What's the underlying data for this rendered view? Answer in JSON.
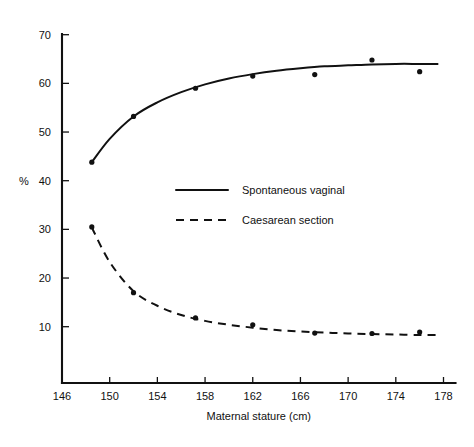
{
  "chart_data": {
    "type": "line",
    "title": "",
    "xlabel": "Maternal stature (cm)",
    "ylabel": "%",
    "xlim": [
      146,
      178
    ],
    "ylim": [
      10,
      70
    ],
    "xticks": [
      146,
      150,
      154,
      158,
      162,
      166,
      170,
      174,
      178
    ],
    "yticks": [
      10,
      20,
      30,
      40,
      50,
      60,
      70
    ],
    "grid": false,
    "legend_position": "center",
    "series": [
      {
        "name": "Spontaneous vaginal",
        "style": "solid",
        "x": [
          148.5,
          152.0,
          157.2,
          162.0,
          167.2,
          172.0,
          176.0
        ],
        "values": [
          43.8,
          53.2,
          59.0,
          61.5,
          61.8,
          64.8,
          62.4
        ],
        "fit_x": [
          148.5,
          150.0,
          152.0,
          154.0,
          156.0,
          158.0,
          160.0,
          162.0,
          164.0,
          166.0,
          168.0,
          170.0,
          172.0,
          174.0,
          176.0,
          177.5
        ],
        "fit_y": [
          43.8,
          48.6,
          53.2,
          56.1,
          58.2,
          59.8,
          61.0,
          61.9,
          62.6,
          63.1,
          63.5,
          63.7,
          63.9,
          64.0,
          64.0,
          64.0
        ]
      },
      {
        "name": "Caesarean section",
        "style": "dashed",
        "x": [
          148.5,
          152.0,
          157.2,
          162.0,
          167.2,
          172.0,
          176.0
        ],
        "values": [
          30.5,
          17.0,
          11.8,
          10.4,
          8.7,
          8.6,
          8.9
        ],
        "fit_x": [
          148.5,
          150.0,
          152.0,
          154.0,
          156.0,
          158.0,
          160.0,
          162.0,
          164.0,
          166.0,
          168.0,
          170.0,
          172.0,
          174.0,
          176.0,
          177.5
        ],
        "fit_y": [
          30.4,
          23.3,
          17.3,
          14.3,
          12.4,
          11.2,
          10.4,
          9.8,
          9.3,
          9.0,
          8.8,
          8.6,
          8.5,
          8.4,
          8.3,
          8.3
        ]
      }
    ]
  },
  "legend": {
    "entries": [
      {
        "label": "Spontaneous vaginal",
        "style": "solid"
      },
      {
        "label": "Caesarean section",
        "style": "dashed"
      }
    ]
  },
  "axes": {
    "y_label": "%",
    "x_label": "Maternal stature (cm)",
    "y_tick_labels": [
      "70",
      "60",
      "50",
      "40",
      "30",
      "20",
      "10"
    ],
    "x_tick_labels": [
      "146",
      "150",
      "154",
      "158",
      "162",
      "166",
      "170",
      "174",
      "178"
    ]
  },
  "colors": {
    "ink": "#111111",
    "background": "#ffffff"
  }
}
